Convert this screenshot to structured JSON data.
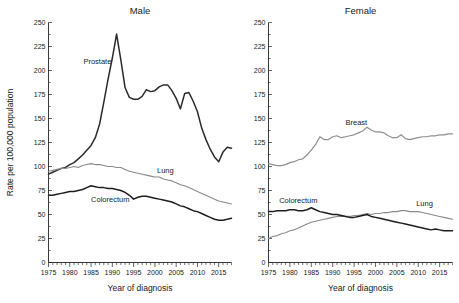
{
  "figure": {
    "yaxis_title": "Rate per 100,000 population",
    "xaxis_title": "Year of diagnosis"
  },
  "panels": {
    "male": {
      "title": "Male"
    },
    "female": {
      "title": "Female"
    }
  },
  "chart_data": [
    {
      "type": "line",
      "title": "Male",
      "xlabel": "Year of diagnosis",
      "ylabel": "Rate per 100,000 population",
      "xlim": [
        1975,
        2018
      ],
      "ylim": [
        0,
        250
      ],
      "ytick_labels": [
        "0",
        "25",
        "50",
        "75",
        "100",
        "125",
        "150",
        "175",
        "200",
        "225",
        "250"
      ],
      "yticks": [
        0,
        25,
        50,
        75,
        100,
        125,
        150,
        175,
        200,
        225,
        250
      ],
      "xticks": [
        1975,
        1980,
        1985,
        1990,
        1995,
        2000,
        2005,
        2010,
        2015
      ],
      "xtick_labels": [
        "1975",
        "1980",
        "1985",
        "1990",
        "1995",
        "2000",
        "2005",
        "2010",
        "2015"
      ],
      "minor_xtick_step": 1,
      "grid": false,
      "legend": "inline-annotations",
      "x": [
        1975,
        1976,
        1977,
        1978,
        1979,
        1980,
        1981,
        1982,
        1983,
        1984,
        1985,
        1986,
        1987,
        1988,
        1989,
        1990,
        1991,
        1992,
        1993,
        1994,
        1995,
        1996,
        1997,
        1998,
        1999,
        2000,
        2001,
        2002,
        2003,
        2004,
        2005,
        2006,
        2007,
        2008,
        2009,
        2010,
        2011,
        2012,
        2013,
        2014,
        2015,
        2016,
        2017,
        2018
      ],
      "series": [
        {
          "name": "Prostate",
          "color": "#2b2b2b",
          "width": 1.5,
          "label_x": 1983.2,
          "label_y": 207,
          "values": [
            92,
            94,
            96,
            98,
            99,
            102,
            104,
            108,
            112,
            117,
            122,
            130,
            144,
            167,
            191,
            213,
            238,
            211,
            182,
            172,
            170,
            170,
            173,
            180,
            178,
            179,
            183,
            185,
            185,
            179,
            171,
            160,
            176,
            177,
            168,
            157,
            140,
            128,
            118,
            110,
            105,
            115,
            120,
            119
          ]
        },
        {
          "name": "Lung",
          "color": "#8a8a8a",
          "width": 1.1,
          "label_x": 2000.5,
          "label_y": 93,
          "values": [
            95,
            96,
            97,
            98,
            98,
            99,
            100,
            99,
            101,
            102,
            103,
            102,
            102,
            101,
            100,
            100,
            99,
            99,
            97,
            95,
            94,
            93,
            92,
            91,
            90,
            89,
            89,
            87,
            86,
            85,
            83,
            81,
            80,
            78,
            76,
            74,
            72,
            70,
            68,
            66,
            64,
            63,
            62,
            61
          ]
        },
        {
          "name": "Colorectum",
          "color": "#1e1e1e",
          "width": 1.5,
          "label_x": 1985.0,
          "label_y": 63,
          "values": [
            70,
            70,
            71,
            72,
            73,
            74,
            74,
            75,
            76,
            78,
            80,
            79,
            78,
            78,
            77,
            77,
            76,
            75,
            73,
            70,
            66,
            68,
            69,
            69,
            68,
            67,
            66,
            65,
            64,
            63,
            61,
            59,
            58,
            56,
            54,
            53,
            51,
            49,
            47,
            45,
            44,
            44,
            45,
            46
          ]
        }
      ]
    },
    {
      "type": "line",
      "title": "Female",
      "xlabel": "Year of diagnosis",
      "ylabel": "Rate per 100,000 population",
      "xlim": [
        1975,
        2018
      ],
      "ylim": [
        0,
        250
      ],
      "ytick_labels": [
        "0",
        "25",
        "50",
        "75",
        "100",
        "125",
        "150",
        "175",
        "200",
        "225",
        "250"
      ],
      "yticks": [
        0,
        25,
        50,
        75,
        100,
        125,
        150,
        175,
        200,
        225,
        250
      ],
      "xticks": [
        1975,
        1980,
        1985,
        1990,
        1995,
        2000,
        2005,
        2010,
        2015
      ],
      "xtick_labels": [
        "1975",
        "1980",
        "1985",
        "1990",
        "1995",
        "2000",
        "2005",
        "2010",
        "2015"
      ],
      "minor_xtick_step": 1,
      "grid": false,
      "legend": "inline-annotations",
      "x": [
        1975,
        1976,
        1977,
        1978,
        1979,
        1980,
        1981,
        1982,
        1983,
        1984,
        1985,
        1986,
        1987,
        1988,
        1989,
        1990,
        1991,
        1992,
        1993,
        1994,
        1995,
        1996,
        1997,
        1998,
        1999,
        2000,
        2001,
        2002,
        2003,
        2004,
        2005,
        2006,
        2007,
        2008,
        2009,
        2010,
        2011,
        2012,
        2013,
        2014,
        2015,
        2016,
        2017,
        2018
      ],
      "series": [
        {
          "name": "Breast",
          "color": "#8f8f8f",
          "width": 1.2,
          "label_x": 1993.0,
          "label_y": 143,
          "values": [
            103,
            102,
            101,
            101,
            102,
            104,
            105,
            107,
            108,
            112,
            117,
            123,
            131,
            128,
            128,
            131,
            132,
            130,
            131,
            132,
            133,
            135,
            137,
            141,
            138,
            136,
            136,
            135,
            132,
            130,
            130,
            133,
            129,
            128,
            129,
            130,
            131,
            131,
            132,
            132,
            133,
            133,
            134,
            134
          ]
        },
        {
          "name": "Lung",
          "color": "#8a8a8a",
          "width": 1.1,
          "label_x": 2009.5,
          "label_y": 59,
          "values": [
            25,
            27,
            28,
            30,
            31,
            33,
            34,
            36,
            38,
            40,
            42,
            43,
            44,
            45,
            46,
            47,
            48,
            48,
            48,
            48,
            49,
            49,
            50,
            51,
            50,
            51,
            51,
            52,
            52,
            53,
            53,
            54,
            54,
            53,
            53,
            53,
            52,
            51,
            50,
            49,
            48,
            47,
            46,
            45
          ]
        },
        {
          "name": "Colorectum",
          "color": "#1e1e1e",
          "width": 1.5,
          "label_x": 1977.5,
          "label_y": 62,
          "values": [
            53,
            53,
            54,
            54,
            54,
            55,
            55,
            54,
            54,
            55,
            57,
            55,
            53,
            52,
            51,
            50,
            50,
            49,
            48,
            47,
            47,
            48,
            49,
            50,
            48,
            47,
            46,
            45,
            44,
            43,
            42,
            41,
            40,
            39,
            38,
            37,
            36,
            35,
            34,
            35,
            34,
            33,
            33,
            33
          ]
        }
      ]
    }
  ]
}
